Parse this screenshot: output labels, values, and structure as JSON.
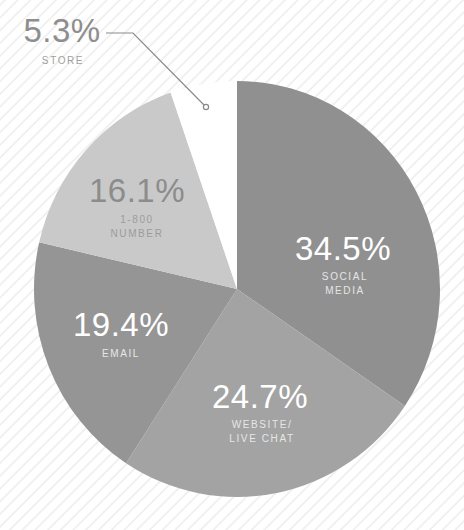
{
  "chart_data": {
    "type": "pie",
    "title": "",
    "start_angle_deg": 0,
    "direction": "clockwise",
    "slices": [
      {
        "key": "social_media",
        "value": 34.5,
        "pct_label": "34.5%",
        "label": "SOCIAL\nMEDIA",
        "color": "#909090"
      },
      {
        "key": "website_live_chat",
        "value": 24.7,
        "pct_label": "24.7%",
        "label": "WEBSITE/\nLIVE CHAT",
        "color": "#a3a3a3"
      },
      {
        "key": "email",
        "value": 19.4,
        "pct_label": "19.4%",
        "label": "EMAIL",
        "color": "#959595"
      },
      {
        "key": "number_1800",
        "value": 16.1,
        "pct_label": "16.1%",
        "label": "1-800\nNUMBER",
        "color": "#c9c9c9"
      },
      {
        "key": "store",
        "value": 5.3,
        "pct_label": "5.3%",
        "label": "STORE",
        "color": "#ffffff"
      }
    ],
    "categories": [
      "SOCIAL MEDIA",
      "WEBSITE/LIVE CHAT",
      "EMAIL",
      "1-800 NUMBER",
      "STORE"
    ],
    "values": [
      34.5,
      24.7,
      19.4,
      16.1,
      5.3
    ],
    "legend": "none (labels inside slices, STORE via leader line)"
  },
  "labels": {
    "social": {
      "pct": "34.5%",
      "name": "SOCIAL\nMEDIA"
    },
    "website": {
      "pct": "24.7%",
      "name": "WEBSITE/\nLIVE CHAT"
    },
    "email": {
      "pct": "19.4%",
      "name": "EMAIL"
    },
    "number": {
      "pct": "16.1%",
      "name": "1-800\nNUMBER"
    },
    "store": {
      "pct": "5.3%",
      "name": "STORE"
    }
  }
}
